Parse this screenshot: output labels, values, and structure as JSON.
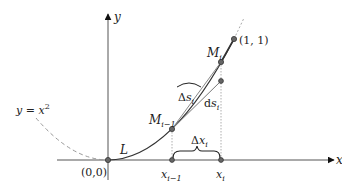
{
  "diagram": {
    "axes": {
      "x_label": "x",
      "y_label": "y",
      "origin_label": "(0,0)"
    },
    "curve": {
      "label": "y = x",
      "exponent": "2",
      "arc_label": "L"
    },
    "points": {
      "m_prev": {
        "label": "M",
        "sub": "i−1"
      },
      "m_i": {
        "label": "M",
        "sub": "i"
      },
      "end": {
        "label": "(1, 1)"
      }
    },
    "ticks": {
      "x_prev": {
        "label": "x",
        "sub": "i−1"
      },
      "x_i": {
        "label": "x",
        "sub": "i"
      }
    },
    "annotations": {
      "delta_x": {
        "prefix": "Δ",
        "var": "x",
        "sub": "i"
      },
      "delta_s": {
        "prefix": "Δ",
        "var": "s",
        "sub": "i"
      },
      "ds": {
        "prefix": "d",
        "var": "s",
        "sub": "i"
      }
    },
    "colors": {
      "curve": "#333333",
      "axis": "#555555",
      "tangent": "#777777",
      "dashed": "#999999",
      "point_fill": "#666666"
    }
  }
}
